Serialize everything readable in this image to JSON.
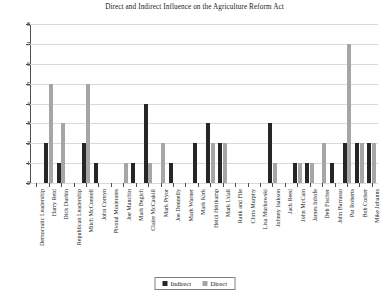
{
  "chart_data": {
    "type": "bar",
    "title": "Direct and Indirect Influence on the Agriculture Reform Act",
    "xlabel": "",
    "ylabel": "",
    "ylim": [
      0,
      8
    ],
    "yticks": [
      0,
      1,
      2,
      3,
      4,
      5,
      6,
      7,
      8
    ],
    "grid": true,
    "legend_position": "bottom-center",
    "categories": [
      "Democratic Leadership",
      "Harry Reid",
      "Dick Durbin",
      "Republican Leadership",
      "Mitch McConnell",
      "John Cornyn",
      "Pivotal Moderates",
      "Joe Manchin",
      "Mark Begich",
      "Claire McCaskill",
      "Mark Pryor",
      "Joe Donnelly",
      "Mark Warner",
      "Mark Kirk",
      "Heidi Heitkamp",
      "Mark Udall",
      "Rank and File",
      "Chris Murphy",
      "Lisa Murkowski",
      "Johnny Isakson",
      "Jack Reed",
      "John McCain",
      "James Inhofe",
      "Deb Fischer",
      "John Barrasso",
      "Pat Roberts",
      "Bob Corker",
      "Mike Johanns"
    ],
    "series": [
      {
        "name": "Indirect",
        "color": "#262626",
        "values": [
          0,
          2,
          1,
          0,
          2,
          1,
          0,
          0,
          1,
          4,
          0,
          1,
          0,
          2,
          3,
          2,
          0,
          0,
          0,
          3,
          0,
          1,
          1,
          0,
          1,
          2,
          2,
          2
        ]
      },
      {
        "name": "Direct",
        "color": "#a6a6a6",
        "values": [
          0,
          5,
          3,
          0,
          5,
          0,
          0,
          1,
          0,
          1,
          2,
          0,
          0,
          0,
          2,
          2,
          0,
          0,
          0,
          1,
          0,
          1,
          1,
          2,
          0,
          7,
          2,
          2
        ]
      }
    ]
  },
  "legend": {
    "items": [
      {
        "label": "Indirect",
        "color": "#262626"
      },
      {
        "label": "Direct",
        "color": "#a6a6a6"
      }
    ]
  }
}
